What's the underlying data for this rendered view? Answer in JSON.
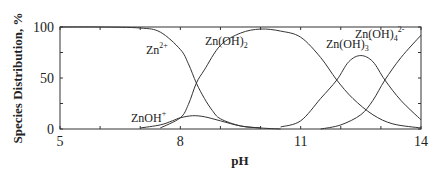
{
  "chart_data": {
    "type": "line",
    "title": "",
    "xlabel": "pH",
    "ylabel": "Species Distribution, %",
    "xlim": [
      5,
      14
    ],
    "ylim": [
      0,
      100
    ],
    "xticks": [
      5,
      8,
      11,
      14
    ],
    "yticks": [
      0,
      50,
      100
    ],
    "grid": false,
    "legend": "inline labels",
    "series": [
      {
        "name": "Zn2+",
        "label": "Zn",
        "sup": "2+",
        "sub": "",
        "x": [
          5,
          6,
          7,
          7.5,
          8,
          8.2,
          8.4,
          8.6,
          8.8,
          9,
          9.5,
          10,
          10.5
        ],
        "values": [
          100,
          100,
          99,
          95,
          78,
          64,
          45,
          30,
          18,
          10,
          3,
          1,
          0
        ]
      },
      {
        "name": "ZnOH+",
        "label": "ZnOH",
        "sup": "+",
        "sub": "",
        "x": [
          7,
          7.5,
          7.8,
          8,
          8.3,
          8.6,
          9,
          9.5,
          10
        ],
        "values": [
          1,
          4,
          8,
          11,
          13,
          12,
          8,
          3,
          1
        ]
      },
      {
        "name": "Zn(OH)2",
        "label": "Zn(OH)",
        "sup": "",
        "sub": "2",
        "x": [
          7.5,
          8,
          8.2,
          8.4,
          8.6,
          9,
          9.5,
          10,
          10.5,
          11,
          11.5,
          11.9,
          12.3,
          12.8,
          13.3,
          14
        ],
        "values": [
          1,
          11,
          24,
          45,
          58,
          82,
          94,
          98,
          96,
          90,
          70,
          48,
          30,
          14,
          5,
          1
        ]
      },
      {
        "name": "Zn(OH)3-",
        "label": "Zn(OH)",
        "sup": "-",
        "sub": "3",
        "x": [
          10.5,
          11,
          11.5,
          11.9,
          12.2,
          12.5,
          12.8,
          13.1,
          13.5,
          14
        ],
        "values": [
          2,
          8,
          30,
          48,
          66,
          72,
          66,
          48,
          28,
          9
        ]
      },
      {
        "name": "Zn(OH)4 2-",
        "label": "Zn(OH)",
        "sup": "2-",
        "sub": "4",
        "x": [
          11.5,
          12,
          12.5,
          12.8,
          13.1,
          13.5,
          14
        ],
        "values": [
          0,
          4,
          14,
          28,
          48,
          70,
          92
        ]
      }
    ]
  }
}
